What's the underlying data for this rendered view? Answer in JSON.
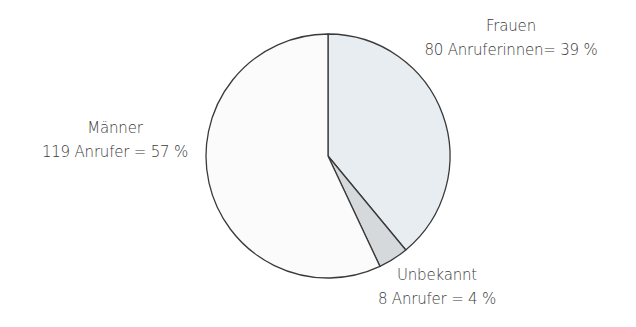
{
  "chart_data": {
    "type": "pie",
    "title": "",
    "start_angle_deg": 0,
    "direction": "clockwise",
    "slices": [
      {
        "name": "Frauen",
        "count": 80,
        "count_label": "80 Anruferinnen= 39 %",
        "percent": 39,
        "color": "#e8edf2"
      },
      {
        "name": "Unbekannt",
        "count": 8,
        "count_label": "8 Anrufer = 4 %",
        "percent": 4,
        "color": "#d6d9dc"
      },
      {
        "name": "Männer",
        "count": 119,
        "count_label": "119 Anrufer = 57 %",
        "percent": 57,
        "color": "#fbfbfb"
      }
    ],
    "categories": [
      "Frauen",
      "Unbekannt",
      "Männer"
    ],
    "values": [
      80,
      8,
      119
    ],
    "percentages": [
      39,
      4,
      57
    ],
    "stroke_color": "#3a3a3a",
    "legend": "none (direct labels)"
  },
  "labels": {
    "frauen": {
      "title": "Frauen",
      "detail": "80 Anruferinnen= 39 %"
    },
    "unbekannt": {
      "title": "Unbekannt",
      "detail": "8 Anrufer = 4 %"
    },
    "maenner": {
      "title": "Männer",
      "detail": "119 Anrufer = 57 %"
    }
  }
}
